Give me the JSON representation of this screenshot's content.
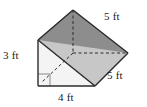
{
  "figure": {
    "kind": "triangular-prism",
    "labels": {
      "height": "3 ft",
      "base": "4 ft",
      "length_top": "5 ft",
      "length_bottom": "5 ft"
    },
    "colors": {
      "top_face": "#8d8d8d",
      "front_right_face": "#c9c9c9",
      "left_triangle_face": "#f2f2f2",
      "outline": "#2b2b2b",
      "hidden_edge": "#2b2b2b",
      "background": "#ffffff",
      "text": "#1a1a1a"
    },
    "markers": {
      "right_angle": "right-angle-square"
    },
    "geometry": {
      "apex_top": [
        73,
        10
      ],
      "back_right": [
        128,
        53
      ],
      "front_bottom_right": [
        95,
        86
      ],
      "front_top_left": [
        38,
        40
      ],
      "front_bottom_left": [
        38,
        86
      ],
      "interior_hidden_vertex": [
        73,
        53
      ]
    }
  }
}
